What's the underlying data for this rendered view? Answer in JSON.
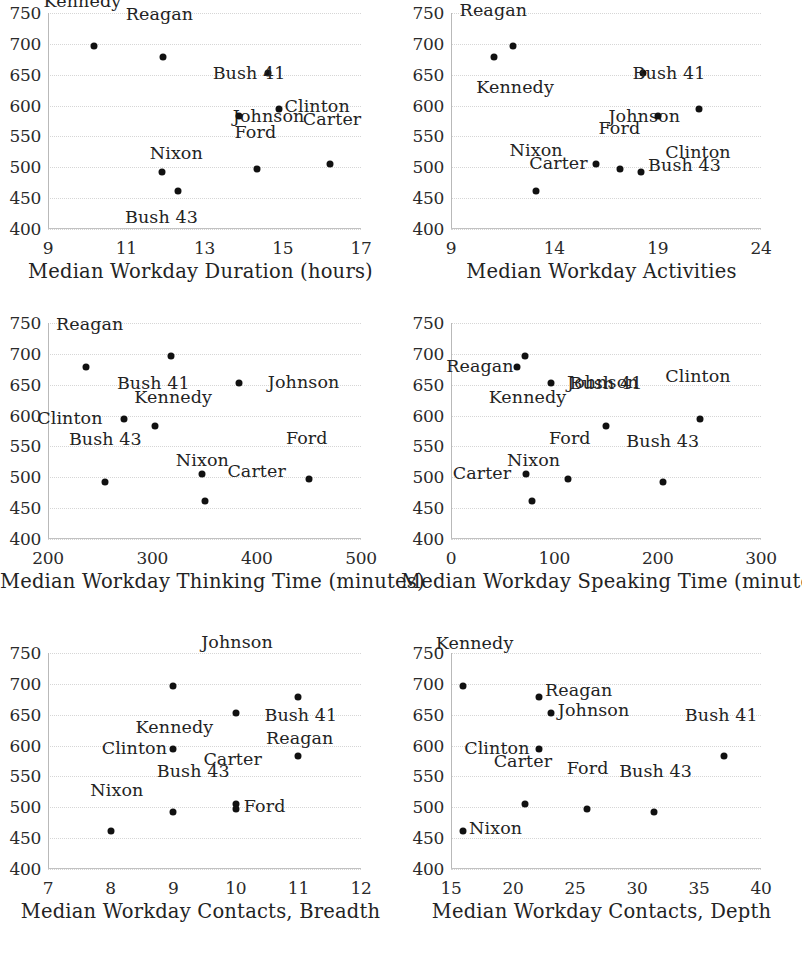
{
  "figure": {
    "panel_count": 6,
    "shared_y_ticks": [
      "750",
      "700",
      "650",
      "600",
      "550",
      "500",
      "450",
      "400"
    ],
    "y_min": 400,
    "y_max": 750,
    "point_color": "#111111",
    "gridline_color": "#d6d6d6",
    "axis_color": "#bbbbbb"
  },
  "chart_data": [
    {
      "type": "scatter",
      "title": "",
      "xlabel": "Median Workday Duration (hours)",
      "ylabel": "",
      "xlim": [
        9,
        17
      ],
      "ylim": [
        400,
        750
      ],
      "xticks": [
        "9",
        "11",
        "13",
        "15",
        "17"
      ],
      "xtick_values": [
        9,
        11,
        13,
        15,
        17
      ],
      "yticks": [
        "750",
        "700",
        "650",
        "600",
        "550",
        "500",
        "450",
        "400"
      ],
      "ytick_values": [
        750,
        700,
        650,
        600,
        550,
        500,
        450,
        400
      ],
      "grid": true,
      "legend": "none",
      "points": [
        {
          "label": "Kennedy",
          "x": 10.18,
          "y": 697,
          "lx": -0.3,
          "ly": -44
        },
        {
          "label": "Reagan",
          "x": 11.95,
          "y": 679,
          "lx": -0.1,
          "ly": -42
        },
        {
          "label": "Johnson",
          "x": 14.62,
          "y": 652,
          "lx": 0.02,
          "ly": 44
        },
        {
          "label": "Clinton",
          "x": 14.9,
          "y": 594,
          "lx": 0.98,
          "ly": -2
        },
        {
          "label": "Bush 41",
          "x": 13.88,
          "y": 583,
          "lx": 0.26,
          "ly": -42
        },
        {
          "label": "Bush 43",
          "x": 11.92,
          "y": 493,
          "lx": -0.02,
          "ly": 46
        },
        {
          "label": "Ford",
          "x": 14.35,
          "y": 497,
          "lx": -0.05,
          "ly": -36
        },
        {
          "label": "Carter",
          "x": 16.22,
          "y": 505,
          "lx": 0.04,
          "ly": -44
        },
        {
          "label": "Nixon",
          "x": 12.33,
          "y": 461,
          "lx": -0.05,
          "ly": -37
        }
      ]
    },
    {
      "type": "scatter",
      "title": "",
      "xlabel": "Median Workday Activities",
      "ylabel": "",
      "xlim": [
        9,
        24
      ],
      "ylim": [
        400,
        750
      ],
      "xticks": [
        "9",
        "14",
        "19",
        "24"
      ],
      "xtick_values": [
        9,
        14,
        19,
        24
      ],
      "yticks": [
        "750",
        "700",
        "650",
        "600",
        "550",
        "500",
        "450",
        "400"
      ],
      "ytick_values": [
        750,
        700,
        650,
        600,
        550,
        500,
        450,
        400
      ],
      "grid": true,
      "legend": "none",
      "points": [
        {
          "label": "Kennedy",
          "x": 12.0,
          "y": 697,
          "lx": 0.1,
          "ly": 42
        },
        {
          "label": "Reagan",
          "x": 11.1,
          "y": 679,
          "lx": -0.05,
          "ly": -46
        },
        {
          "label": "Johnson",
          "x": 18.3,
          "y": 652,
          "lx": 0.05,
          "ly": 44
        },
        {
          "label": "Clinton",
          "x": 21.0,
          "y": 594,
          "lx": -0.05,
          "ly": 44
        },
        {
          "label": "Bush 41",
          "x": 19.0,
          "y": 583,
          "lx": 0.55,
          "ly": -42
        },
        {
          "label": "Carter",
          "x": 16.0,
          "y": 505,
          "lx": -1.8,
          "ly": 0
        },
        {
          "label": "Ford",
          "x": 17.2,
          "y": 497,
          "lx": -0.05,
          "ly": -40
        },
        {
          "label": "Bush 43",
          "x": 18.2,
          "y": 493,
          "lx": 2.1,
          "ly": -6
        },
        {
          "label": "Nixon",
          "x": 13.1,
          "y": 461,
          "lx": 0.02,
          "ly": -40
        }
      ]
    },
    {
      "type": "scatter",
      "title": "",
      "xlabel": "Median Workday Thinking Time (minutes)",
      "ylabel": "",
      "xlim": [
        200,
        500
      ],
      "ylim": [
        400,
        750
      ],
      "xticks": [
        "200",
        "300",
        "400",
        "500"
      ],
      "xtick_values": [
        200,
        300,
        400,
        500
      ],
      "yticks": [
        "750",
        "700",
        "650",
        "600",
        "550",
        "500",
        "450",
        "400"
      ],
      "ytick_values": [
        750,
        700,
        650,
        600,
        550,
        500,
        450,
        400
      ],
      "grid": true,
      "legend": "none",
      "points": [
        {
          "label": "Kennedy",
          "x": 318,
          "y": 697,
          "lx": 2,
          "ly": 42
        },
        {
          "label": "Reagan",
          "x": 236,
          "y": 679,
          "lx": 4,
          "ly": -42
        },
        {
          "label": "Johnson",
          "x": 383,
          "y": 652,
          "lx": 62,
          "ly": 0
        },
        {
          "label": "Clinton",
          "x": 273,
          "y": 594,
          "lx": -52,
          "ly": 0
        },
        {
          "label": "Bush 41",
          "x": 303,
          "y": 583,
          "lx": -2,
          "ly": -42
        },
        {
          "label": "Carter",
          "x": 348,
          "y": 505,
          "lx": 52,
          "ly": -2
        },
        {
          "label": "Ford",
          "x": 450,
          "y": 497,
          "lx": -2,
          "ly": -40
        },
        {
          "label": "Bush 43",
          "x": 255,
          "y": 493,
          "lx": 0,
          "ly": -42
        },
        {
          "label": "Nixon",
          "x": 350,
          "y": 461,
          "lx": -2,
          "ly": -40
        }
      ]
    },
    {
      "type": "scatter",
      "title": "",
      "xlabel": "Median Workday Speaking Time (minutes)",
      "ylabel": "",
      "xlim": [
        0,
        300
      ],
      "ylim": [
        400,
        750
      ],
      "xticks": [
        "0",
        "100",
        "200",
        "300"
      ],
      "xtick_values": [
        0,
        100,
        200,
        300
      ],
      "yticks": [
        "750",
        "700",
        "650",
        "600",
        "550",
        "500",
        "450",
        "400"
      ],
      "ytick_values": [
        750,
        700,
        650,
        600,
        550,
        500,
        450,
        400
      ],
      "grid": true,
      "legend": "none",
      "points": [
        {
          "label": "Kennedy",
          "x": 72,
          "y": 697,
          "lx": 2,
          "ly": 42
        },
        {
          "label": "Reagan",
          "x": 64,
          "y": 679,
          "lx": -36,
          "ly": 0
        },
        {
          "label": "Johnson",
          "x": 97,
          "y": 652,
          "lx": 50,
          "ly": 0
        },
        {
          "label": "Clinton",
          "x": 241,
          "y": 594,
          "lx": -2,
          "ly": -42
        },
        {
          "label": "Bush 41",
          "x": 150,
          "y": 583,
          "lx": 0,
          "ly": -42
        },
        {
          "label": "Carter",
          "x": 73,
          "y": 505,
          "lx": -43,
          "ly": 0
        },
        {
          "label": "Ford",
          "x": 113,
          "y": 497,
          "lx": 2,
          "ly": -40
        },
        {
          "label": "Bush 43",
          "x": 205,
          "y": 493,
          "lx": 0,
          "ly": -40
        },
        {
          "label": "Nixon",
          "x": 78,
          "y": 461,
          "lx": 2,
          "ly": -40
        }
      ]
    },
    {
      "type": "scatter",
      "title": "",
      "xlabel": "Median Workday Contacts, Breadth",
      "ylabel": "",
      "xlim": [
        7,
        12
      ],
      "ylim": [
        400,
        750
      ],
      "xticks": [
        "7",
        "8",
        "9",
        "10",
        "11",
        "12"
      ],
      "xtick_values": [
        7,
        8,
        9,
        10,
        11,
        12
      ],
      "yticks": [
        "750",
        "700",
        "650",
        "600",
        "550",
        "500",
        "450",
        "400"
      ],
      "ytick_values": [
        750,
        700,
        650,
        600,
        550,
        500,
        450,
        400
      ],
      "grid": true,
      "legend": "none",
      "points": [
        {
          "label": "Kennedy",
          "x": 9.0,
          "y": 697,
          "lx": 0.02,
          "ly": 42
        },
        {
          "label": "Reagan",
          "x": 11.0,
          "y": 679,
          "lx": 0.02,
          "ly": 42
        },
        {
          "label": "Johnson",
          "x": 10.0,
          "y": 652,
          "lx": 0.02,
          "ly": -70
        },
        {
          "label": "Clinton",
          "x": 9.0,
          "y": 594,
          "lx": -0.62,
          "ly": 0
        },
        {
          "label": "Bush 41",
          "x": 11.0,
          "y": 583,
          "lx": 0.04,
          "ly": -40
        },
        {
          "label": "Carter",
          "x": 10.0,
          "y": 505,
          "lx": -0.05,
          "ly": -44
        },
        {
          "label": "Ford",
          "x": 10.0,
          "y": 497,
          "lx": 0.46,
          "ly": -2
        },
        {
          "label": "Bush 43",
          "x": 9.0,
          "y": 493,
          "lx": 0.32,
          "ly": -40
        },
        {
          "label": "Nixon",
          "x": 8.0,
          "y": 461,
          "lx": 0.1,
          "ly": -40
        }
      ]
    },
    {
      "type": "scatter",
      "title": "",
      "xlabel": "Median Workday Contacts, Depth",
      "ylabel": "",
      "xlim": [
        15,
        40
      ],
      "ylim": [
        400,
        750
      ],
      "xticks": [
        "15",
        "20",
        "25",
        "30",
        "35",
        "40"
      ],
      "xtick_values": [
        15,
        20,
        25,
        30,
        35,
        40
      ],
      "yticks": [
        "750",
        "700",
        "650",
        "600",
        "550",
        "500",
        "450",
        "400"
      ],
      "ytick_values": [
        750,
        700,
        650,
        600,
        550,
        500,
        450,
        400
      ],
      "grid": true,
      "legend": "none",
      "points": [
        {
          "label": "Kennedy",
          "x": 16.0,
          "y": 697,
          "lx": 0.9,
          "ly": -42
        },
        {
          "label": "Reagan",
          "x": 22.1,
          "y": 679,
          "lx": 3.2,
          "ly": -6
        },
        {
          "label": "Johnson",
          "x": 23.1,
          "y": 652,
          "lx": 3.4,
          "ly": -2
        },
        {
          "label": "Clinton",
          "x": 22.1,
          "y": 594,
          "lx": -3.4,
          "ly": 0
        },
        {
          "label": "Bush 41",
          "x": 37.0,
          "y": 583,
          "lx": -0.2,
          "ly": -40
        },
        {
          "label": "Carter",
          "x": 21.0,
          "y": 505,
          "lx": -0.2,
          "ly": -42
        },
        {
          "label": "Ford",
          "x": 26.0,
          "y": 497,
          "lx": 0.02,
          "ly": -40
        },
        {
          "label": "Bush 43",
          "x": 31.4,
          "y": 493,
          "lx": 0.1,
          "ly": -40
        },
        {
          "label": "Nixon",
          "x": 16.0,
          "y": 461,
          "lx": 2.6,
          "ly": -2
        }
      ]
    }
  ]
}
